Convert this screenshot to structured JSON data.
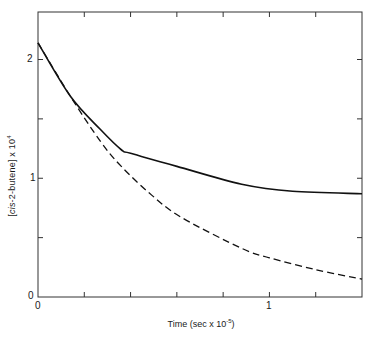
{
  "chart_data": {
    "type": "line",
    "title": "",
    "xlabel": "Time (sec x 10^-5)",
    "xlabel_parts": {
      "base": "Time (sec x 10",
      "exp": "-5",
      "tail": ")"
    },
    "ylabel": "[cis-2-butene] x 10^4",
    "ylabel_parts": {
      "bracket_open": "[",
      "italic": "cis",
      "rest": "-2-butene",
      "bracket_close": "]",
      "mult": " x 10",
      "exp": "4"
    },
    "xlim": [
      0,
      1.4
    ],
    "ylim": [
      0,
      2.4
    ],
    "x_ticks": [
      0,
      0.2,
      0.4,
      0.6,
      0.8,
      1.0,
      1.2,
      1.4
    ],
    "x_tick_labels": [
      {
        "value": 0,
        "label": "0"
      },
      {
        "value": 1,
        "label": "1"
      }
    ],
    "y_ticks": [
      0,
      0.5,
      1.0,
      1.5,
      2.0
    ],
    "y_tick_labels": [
      {
        "value": 0,
        "label": "0"
      },
      {
        "value": 1,
        "label": "1"
      },
      {
        "value": 2,
        "label": "2"
      }
    ],
    "grid": false,
    "legend": null,
    "series": [
      {
        "name": "solid",
        "style": "solid",
        "x": [
          0,
          0.14,
          0.27,
          0.36,
          0.4,
          0.6,
          0.88,
          1.1,
          1.4
        ],
        "values": [
          2.14,
          1.69,
          1.41,
          1.24,
          1.21,
          1.1,
          0.95,
          0.89,
          0.87
        ]
      },
      {
        "name": "dashed",
        "style": "dashed",
        "x": [
          0,
          0.14,
          0.27,
          0.36,
          0.49,
          0.62,
          0.88,
          1.0,
          1.2,
          1.4
        ],
        "values": [
          2.14,
          1.69,
          1.31,
          1.1,
          0.86,
          0.67,
          0.41,
          0.33,
          0.23,
          0.15
        ]
      }
    ]
  },
  "labels": {
    "x_zero": "0",
    "x_one": "1",
    "y_zero": "0",
    "y_one": "1",
    "y_two": "2"
  }
}
